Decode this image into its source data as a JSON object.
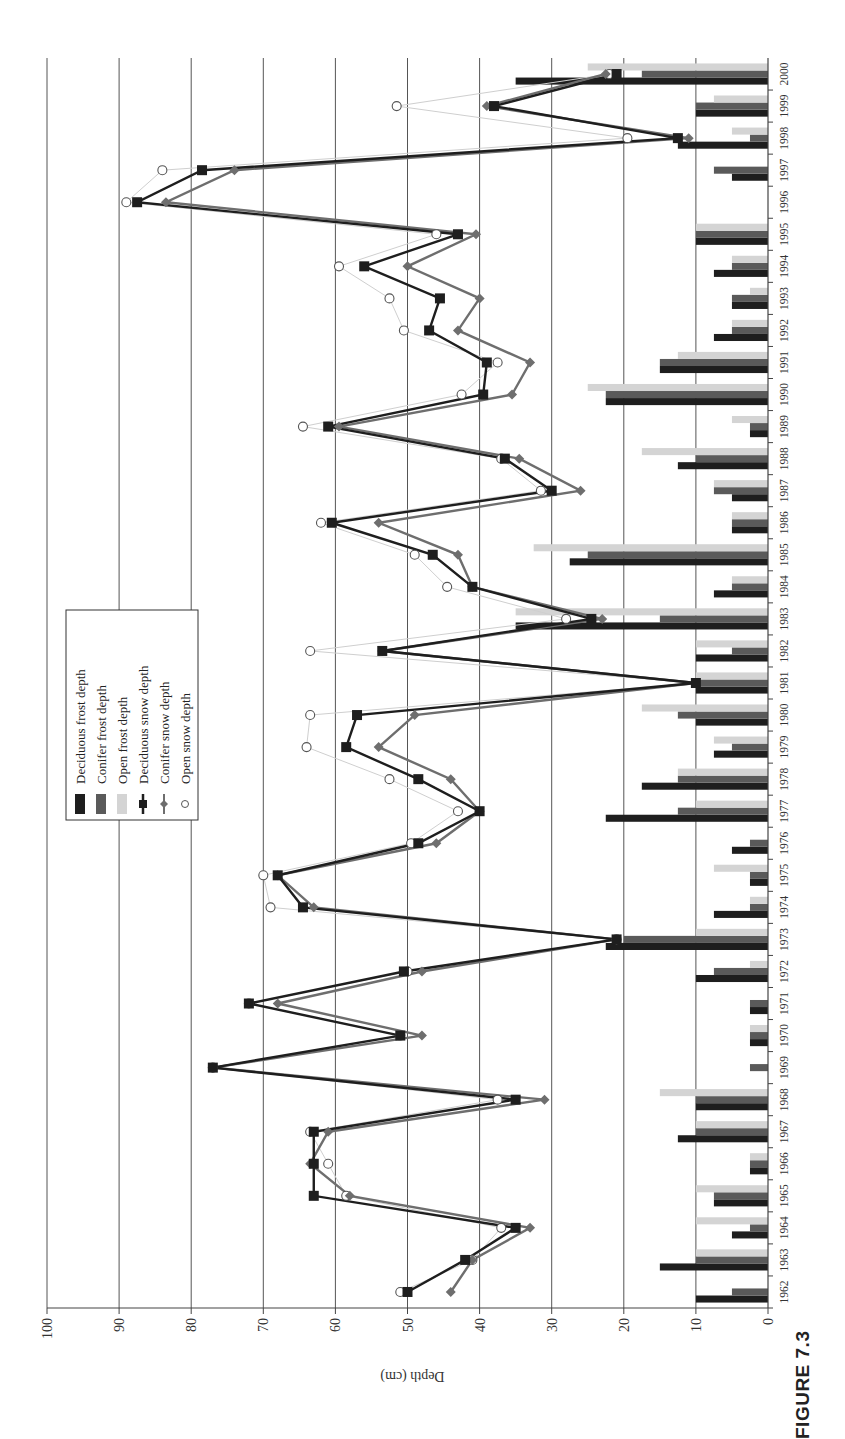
{
  "figure": {
    "label": "FIGURE 7.3"
  },
  "chart_data": {
    "type": "bar+line",
    "orientation": "rotated 90 degrees counterclockwise (years on vertical axis, depth on horizontal axis)",
    "title": "",
    "xlabel": "",
    "ylabel": "Depth (cm)",
    "ylim": [
      0,
      100
    ],
    "yticks": [
      0,
      10,
      20,
      30,
      40,
      50,
      60,
      70,
      80,
      90,
      100
    ],
    "grid": true,
    "legend_position": "inside, upper-middle",
    "categories": [
      "1962",
      "1963",
      "1964",
      "1965",
      "1966",
      "1967",
      "1968",
      "1969",
      "1970",
      "1971",
      "1972",
      "1973",
      "1974",
      "1975",
      "1976",
      "1977",
      "1978",
      "1979",
      "1980",
      "1981",
      "1982",
      "1983",
      "1984",
      "1985",
      "1986",
      "1987",
      "1988",
      "1989",
      "1990",
      "1991",
      "1992",
      "1993",
      "1994",
      "1995",
      "1996",
      "1997",
      "1998",
      "1999",
      "2000"
    ],
    "series": [
      {
        "name": "Deciduous frost depth",
        "kind": "bar",
        "color": "#1e1e1e",
        "values": [
          10,
          15,
          5,
          7.5,
          2.5,
          12.5,
          10,
          0,
          2.5,
          2.5,
          10,
          22.5,
          7.5,
          2.5,
          5,
          22.5,
          17.5,
          7.5,
          10,
          10,
          10,
          35,
          7.5,
          27.5,
          5,
          5,
          12.5,
          2.5,
          22.5,
          15,
          7.5,
          5,
          7.5,
          10,
          0,
          5,
          12.5,
          10,
          35
        ]
      },
      {
        "name": "Conifer frost depth",
        "kind": "bar",
        "color": "#5a5a5a",
        "values": [
          5,
          10,
          2.5,
          7.5,
          2.5,
          10,
          10,
          2.5,
          2.5,
          2.5,
          7.5,
          20,
          2.5,
          2.5,
          2.5,
          12.5,
          12.5,
          5,
          12.5,
          10,
          5,
          15,
          5,
          25,
          5,
          7.5,
          10,
          2.5,
          22.5,
          15,
          5,
          5,
          5,
          10,
          0,
          7.5,
          2.5,
          10,
          17.5
        ]
      },
      {
        "name": "Open frost depth",
        "kind": "bar",
        "color": "#d4d4d4",
        "values": [
          0,
          10,
          10,
          10,
          2.5,
          10,
          15,
          0,
          2.5,
          0,
          2.5,
          10,
          2.5,
          7.5,
          0,
          10,
          12.5,
          7.5,
          17.5,
          10,
          10,
          35,
          5,
          32.5,
          5,
          7.5,
          17.5,
          5,
          25,
          12.5,
          5,
          2.5,
          5,
          10,
          0,
          0,
          5,
          7.5,
          25
        ]
      },
      {
        "name": "Deciduous snow depth",
        "kind": "line",
        "marker": "square",
        "color": "#1e1e1e",
        "values": [
          50,
          42,
          35,
          63,
          63,
          63,
          35,
          77,
          51,
          72,
          50.5,
          21,
          64.5,
          68,
          48.5,
          40,
          48.5,
          58.5,
          57,
          10,
          53.5,
          24.5,
          41,
          46.5,
          60.5,
          30,
          36.5,
          61,
          39.5,
          39,
          47,
          45.5,
          56,
          43,
          87.5,
          78.5,
          12.5,
          38,
          21
        ]
      },
      {
        "name": "Conifer snow depth",
        "kind": "line",
        "marker": "diamond",
        "color": "#6e6e6e",
        "values": [
          44,
          41,
          33,
          58,
          63.5,
          61,
          31,
          77,
          48,
          68,
          48,
          21,
          63,
          68,
          46,
          40,
          44,
          54,
          49,
          10,
          53.5,
          23,
          41,
          43,
          54,
          26,
          34.5,
          59.5,
          35.5,
          33,
          43,
          40,
          50,
          40.5,
          83.5,
          74,
          11,
          39,
          22.5
        ]
      },
      {
        "name": "Open snow depth",
        "kind": "line",
        "marker": "circle",
        "color": "#bdbdbd",
        "values": [
          51,
          41,
          37,
          58.5,
          61,
          63.5,
          37.5,
          77,
          51,
          72,
          50,
          21,
          69,
          70,
          49.5,
          43,
          52.5,
          64,
          63.5,
          10,
          63.5,
          28,
          44.5,
          49,
          62,
          31.5,
          37,
          64.5,
          42.5,
          37.5,
          50.5,
          52.5,
          59.5,
          46,
          89,
          84,
          19.5,
          51.5,
          22
        ]
      }
    ]
  },
  "axis": {
    "depth_label": "Depth (cm)",
    "depth_ticks": [
      "0",
      "10",
      "20",
      "30",
      "40",
      "50",
      "60",
      "70",
      "80",
      "90",
      "100"
    ]
  }
}
